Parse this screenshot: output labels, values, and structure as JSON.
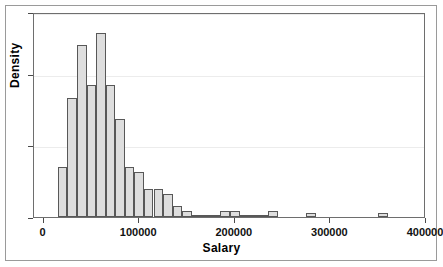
{
  "chart_data": {
    "type": "bar",
    "title": "",
    "subtitle": "",
    "xlabel": "Salary",
    "ylabel": "Density",
    "xlim": [
      -10000,
      400000
    ],
    "ylim": [
      0,
      1
    ],
    "grid": true,
    "legend": null,
    "xticks": [
      0,
      100000,
      200000,
      300000,
      400000
    ],
    "xticklabels": [
      "0",
      "100000",
      "200000",
      "300000",
      "400000"
    ],
    "yticks": [
      0.0,
      0.35,
      0.7,
      1.0
    ],
    "yticklabels": [
      "",
      "",
      "",
      ""
    ],
    "bin_width": 10000,
    "bin_starts": [
      15000,
      25000,
      35000,
      45000,
      55000,
      65000,
      75000,
      85000,
      95000,
      105000,
      115000,
      125000,
      135000,
      145000,
      155000,
      165000,
      175000,
      185000,
      195000,
      205000,
      215000,
      225000,
      235000,
      245000,
      255000,
      275000,
      350000
    ],
    "categories": [
      "15000",
      "25000",
      "35000",
      "45000",
      "55000",
      "65000",
      "75000",
      "85000",
      "95000",
      "105000",
      "115000",
      "125000",
      "135000",
      "145000",
      "155000",
      "165000",
      "175000",
      "185000",
      "195000",
      "205000",
      "215000",
      "225000",
      "235000",
      "245000",
      "255000",
      "275000",
      "350000"
    ],
    "values": [
      0.245,
      0.58,
      0.84,
      0.645,
      0.9,
      0.645,
      0.48,
      0.245,
      0.22,
      0.135,
      0.135,
      0.11,
      0.055,
      0.03,
      0.012,
      0.01,
      0.008,
      0.03,
      0.028,
      0.008,
      0.006,
      0.004,
      0.03,
      0.0,
      0.0,
      0.022,
      0.02
    ],
    "bar_fill_color": "#dedede",
    "bar_edge_color": "#585858",
    "panel_border_color": "#6e6e6e",
    "frame_color": "#9a9a9a",
    "grid_color": "#ececec",
    "background_color": "#ffffff"
  }
}
